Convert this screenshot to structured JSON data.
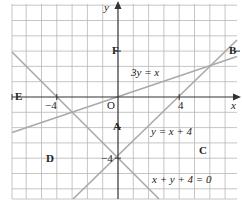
{
  "diagram": {
    "type": "coordinate-graph",
    "axes": {
      "x_label": "x",
      "y_label": "y",
      "origin_label": "O",
      "x_ticks": [
        {
          "value": -4,
          "label": "−4"
        },
        {
          "value": 4,
          "label": "4"
        }
      ],
      "y_ticks": [
        {
          "value": -4,
          "label": "−4"
        }
      ]
    },
    "grid": {
      "x_min": -6.93,
      "x_max": 7.78,
      "y_min": -6.67,
      "y_max": 6.08,
      "step": 1
    },
    "lines": [
      {
        "id": "line-3y-eq-x",
        "label": "3y = x",
        "slope": 0.3333,
        "intercept": 0
      },
      {
        "id": "line-y-eq-x-plus-4",
        "label": "y = x + 4",
        "slope": 1,
        "intercept": -4
      },
      {
        "id": "line-x-plus-y-plus-4",
        "label": "x + y + 4 = 0",
        "slope": -1,
        "intercept": -4
      }
    ],
    "points": [
      {
        "id": "A",
        "label": "A"
      },
      {
        "id": "B",
        "label": "B"
      },
      {
        "id": "C",
        "label": "C"
      },
      {
        "id": "D",
        "label": "D"
      },
      {
        "id": "E",
        "label": "E"
      },
      {
        "id": "F",
        "label": "F"
      }
    ],
    "colors": {
      "grid": "#b8b8b8",
      "axis": "#333333",
      "line": "#a9a9a9",
      "text": "#222222"
    }
  }
}
